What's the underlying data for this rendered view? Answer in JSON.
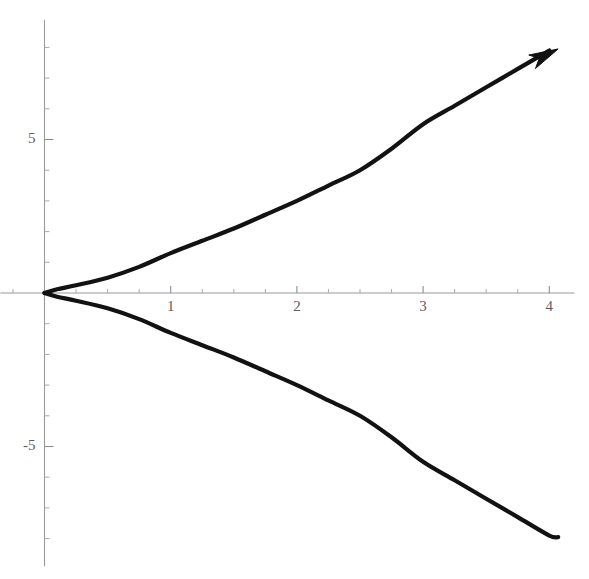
{
  "figure": {
    "title": "",
    "background_color": "#ffffff",
    "width": 589,
    "height": 579
  },
  "axes": {
    "x_axis_label": "",
    "y_axis_label": "",
    "x_tick_labels": [
      "1",
      "2",
      "3",
      "4"
    ],
    "y_tick_labels": [
      "5",
      "-5"
    ],
    "axis_color": "#9a9a9a",
    "tick_color": "#8e8e8e",
    "label_color": "#5d5d5d"
  },
  "curves": {
    "stroke_color": "#121212",
    "stroke_width": 4.2,
    "upper_branch_name": "upper-branch",
    "lower_branch_name": "lower-branch",
    "arrow_name": "arrow-head"
  },
  "chart_data": {
    "type": "line",
    "title": "",
    "subtitle": "",
    "xlabel": "",
    "ylabel": "",
    "xlim": [
      -0.35,
      4.2
    ],
    "ylim": [
      -8.9,
      8.9
    ],
    "grid": false,
    "legend": "none",
    "x_ticks": [
      1,
      2,
      3,
      4
    ],
    "x_tick_labels": [
      "1",
      "2",
      "3",
      "4"
    ],
    "y_ticks": [
      5,
      -5
    ],
    "y_tick_labels": [
      "5",
      "-5"
    ],
    "x_minor_tick_step": 0.25,
    "y_minor_tick_step": 1,
    "annotations": [
      {
        "name": "arrow-head",
        "kind": "arrow",
        "x": 4.07,
        "y": 7.95,
        "direction": "up-right"
      }
    ],
    "series": [
      {
        "name": "upper-branch",
        "color": "#121212",
        "x": [
          0,
          0.1,
          0.25,
          0.5,
          0.75,
          1,
          1.25,
          1.5,
          1.75,
          2,
          2.25,
          2.5,
          2.75,
          3,
          3.25,
          3.5,
          3.75,
          4,
          4.07
        ],
        "values": [
          0,
          0.12,
          0.25,
          0.5,
          0.85,
          1.3,
          1.7,
          2.1,
          2.55,
          3.0,
          3.5,
          4.0,
          4.7,
          5.5,
          6.1,
          6.7,
          7.3,
          7.9,
          7.95
        ]
      },
      {
        "name": "lower-branch",
        "color": "#121212",
        "x": [
          0,
          0.1,
          0.25,
          0.5,
          0.75,
          1,
          1.25,
          1.5,
          1.75,
          2,
          2.25,
          2.5,
          2.75,
          3,
          3.25,
          3.5,
          3.75,
          4,
          4.07
        ],
        "values": [
          0,
          -0.12,
          -0.25,
          -0.5,
          -0.85,
          -1.3,
          -1.7,
          -2.1,
          -2.55,
          -3.0,
          -3.5,
          -4.0,
          -4.7,
          -5.5,
          -6.1,
          -6.7,
          -7.3,
          -7.9,
          -7.95
        ]
      }
    ]
  }
}
